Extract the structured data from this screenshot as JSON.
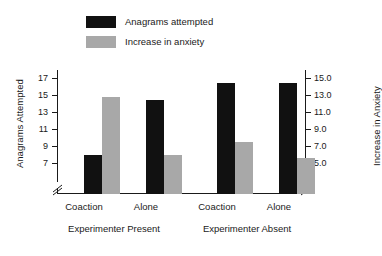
{
  "chart_data": {
    "type": "bar",
    "title": "",
    "categories": [
      "Coaction",
      "Alone",
      "Coaction",
      "Alone"
    ],
    "groups": [
      {
        "label": "Experimenter Present",
        "categories": [
          "Coaction",
          "Alone"
        ]
      },
      {
        "label": "Experimenter Absent",
        "categories": [
          "Coaction",
          "Alone"
        ]
      }
    ],
    "series": [
      {
        "name": "Anagrams attempted",
        "color": "#111111",
        "axis": "left",
        "values": [
          8.0,
          14.4,
          16.4,
          16.4
        ]
      },
      {
        "name": "Increase in anxiety",
        "color": "#a8a8a8",
        "axis": "right",
        "values": [
          12.8,
          5.9,
          7.5,
          5.6
        ]
      }
    ],
    "left_axis": {
      "label": "Anagrams Attempted",
      "ticks": [
        "7",
        "9",
        "11",
        "13",
        "15",
        "17"
      ],
      "tick_values": [
        7,
        9,
        11,
        13,
        15,
        17
      ],
      "ylim": [
        7,
        17
      ],
      "axis_break": true
    },
    "right_axis": {
      "label": "Increase in Anxiety",
      "ticks": [
        "5.0",
        "7.0",
        "9.0",
        "11.0",
        "13.0",
        "15.0"
      ],
      "tick_values": [
        5.0,
        7.0,
        9.0,
        11.0,
        13.0,
        15.0
      ],
      "ylim": [
        5.0,
        15.0
      ],
      "axis_break": true
    },
    "xlabel": "",
    "grid": false,
    "legend_position": "top-left",
    "legend": [
      {
        "label": "Anagrams attempted",
        "color": "#111111"
      },
      {
        "label": "Increase in anxiety",
        "color": "#a8a8a8"
      }
    ]
  }
}
